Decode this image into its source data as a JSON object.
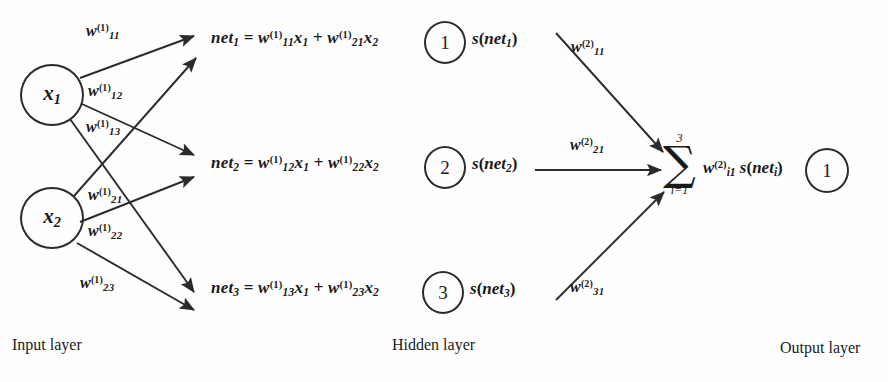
{
  "diagram": {
    "colors": {
      "background": "#fefefe",
      "stroke": "#2b2b2b",
      "text": "#1a1a1a"
    },
    "input_layer": {
      "caption": "Input layer",
      "nodes": [
        {
          "label": "x",
          "subscript": "1"
        },
        {
          "label": "x",
          "subscript": "2"
        }
      ]
    },
    "hidden_layer": {
      "caption": "Hidden layer",
      "nodes": [
        {
          "label": "1"
        },
        {
          "label": "2"
        },
        {
          "label": "3"
        }
      ],
      "equations": [
        {
          "lhs": "net",
          "lhs_sub": "1",
          "eq": "=",
          "term1_w": "w",
          "term1_sub": "11",
          "term1_sup": "(1)",
          "term1_x": "x",
          "term1_xsub": "1",
          "plus": "+",
          "term2_w": "w",
          "term2_sub": "21",
          "term2_sup": "(1)",
          "term2_x": "x",
          "term2_xsub": "2"
        },
        {
          "lhs": "net",
          "lhs_sub": "2",
          "eq": "=",
          "term1_w": "w",
          "term1_sub": "12",
          "term1_sup": "(1)",
          "term1_x": "x",
          "term1_xsub": "1",
          "plus": "+",
          "term2_w": "w",
          "term2_sub": "22",
          "term2_sup": "(1)",
          "term2_x": "x",
          "term2_xsub": "2"
        },
        {
          "lhs": "net",
          "lhs_sub": "3",
          "eq": "=",
          "term1_w": "w",
          "term1_sub": "13",
          "term1_sup": "(1)",
          "term1_x": "x",
          "term1_xsub": "1",
          "plus": "+",
          "term2_w": "w",
          "term2_sub": "23",
          "term2_sup": "(1)",
          "term2_x": "x",
          "term2_xsub": "2"
        }
      ],
      "activations": [
        {
          "fn": "s",
          "open": "(",
          "arg": "net",
          "arg_sub": "1",
          "close": ")"
        },
        {
          "fn": "s",
          "open": "(",
          "arg": "net",
          "arg_sub": "2",
          "close": ")"
        },
        {
          "fn": "s",
          "open": "(",
          "arg": "net",
          "arg_sub": "3",
          "close": ")"
        }
      ]
    },
    "output_layer": {
      "caption": "Output layer",
      "nodes": [
        {
          "label": "1"
        }
      ],
      "summation": {
        "upper": "3",
        "glyph": "∑",
        "lower": "i=1",
        "w": "w",
        "w_sub": "i1",
        "w_sup": "(2)",
        "fn": "s",
        "open": "(",
        "arg": "net",
        "arg_sub": "i",
        "close": ")"
      }
    },
    "input_weights": [
      {
        "w": "w",
        "sub": "11",
        "sup": "(1)",
        "from": "x1",
        "to": "net1"
      },
      {
        "w": "w",
        "sub": "12",
        "sup": "(1)",
        "from": "x1",
        "to": "net2"
      },
      {
        "w": "w",
        "sub": "13",
        "sup": "(1)",
        "from": "x1",
        "to": "net3"
      },
      {
        "w": "w",
        "sub": "21",
        "sup": "(1)",
        "from": "x2",
        "to": "net1"
      },
      {
        "w": "w",
        "sub": "22",
        "sup": "(1)",
        "from": "x2",
        "to": "net2"
      },
      {
        "w": "w",
        "sub": "23",
        "sup": "(1)",
        "from": "x2",
        "to": "net3"
      }
    ],
    "output_weights": [
      {
        "w": "w",
        "sub": "11",
        "sup": "(2)",
        "from": "hidden1",
        "to": "output"
      },
      {
        "w": "w",
        "sub": "21",
        "sup": "(2)",
        "from": "hidden2",
        "to": "output"
      },
      {
        "w": "w",
        "sub": "31",
        "sup": "(2)",
        "from": "hidden3",
        "to": "output"
      }
    ]
  }
}
